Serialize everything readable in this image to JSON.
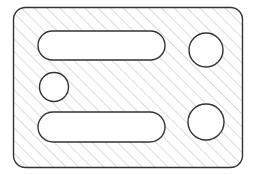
{
  "document": {
    "title": "Hatched Plate Section Drawing",
    "type": "technical-drawing",
    "canvas": {
      "width": 255,
      "height": 175,
      "background": "#ffffff"
    }
  },
  "style": {
    "outline_color": "#333333",
    "outline_width": 1.4,
    "hatch_color": "#b0b0b0",
    "hatch_width": 0.9,
    "hatch_angle_deg": 45,
    "hatch_spacing_px": 9,
    "fill_color": "#ffffff",
    "hole_fill_color": "#ffffff"
  },
  "geometry": {
    "plate": {
      "label": "Hatched plate outline",
      "shape": "rounded-rectangle",
      "x": 13.5,
      "y": 7.5,
      "width": 229,
      "height": 160,
      "corner_radius": 12
    },
    "features": [
      {
        "id": "slot-top",
        "label": "Upper elongated slot",
        "shape": "stadium",
        "x": 38,
        "y": 31,
        "width": 127,
        "height": 29,
        "corner_radius": 14.5
      },
      {
        "id": "hole-small-left",
        "label": "Small left circular hole",
        "shape": "circle",
        "cx": 54,
        "cy": 87,
        "r": 14.5
      },
      {
        "id": "slot-bottom",
        "label": "Lower elongated slot",
        "shape": "stadium",
        "x": 38,
        "y": 112,
        "width": 127,
        "height": 30,
        "corner_radius": 15
      },
      {
        "id": "hole-top-right",
        "label": "Upper right circular hole",
        "shape": "circle",
        "cx": 206,
        "cy": 50,
        "r": 17
      },
      {
        "id": "hole-bottom-right",
        "label": "Lower right circular hole",
        "shape": "circle",
        "cx": 206,
        "cy": 122,
        "r": 18
      }
    ]
  }
}
